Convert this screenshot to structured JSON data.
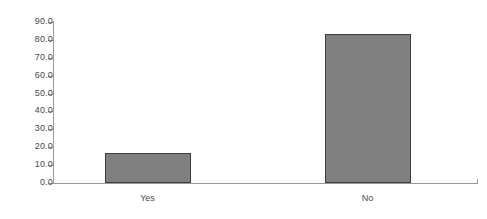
{
  "chart_data": {
    "type": "bar",
    "title": "",
    "subtitle": "",
    "xlabel": "",
    "ylabel": "",
    "categories": [
      "Yes",
      "No"
    ],
    "values": [
      16.5,
      83.5
    ],
    "ylim": [
      0.0,
      90.0
    ],
    "ytick_step": 10.0,
    "ytick_labels": [
      "0.0",
      "10.0",
      "20.0",
      "30.0",
      "40.0",
      "50.0",
      "60.0",
      "70.0",
      "80.0",
      "90.0"
    ],
    "ytick_values": [
      0.0,
      10.0,
      20.0,
      30.0,
      40.0,
      50.0,
      60.0,
      70.0,
      80.0,
      90.0
    ],
    "grid": false,
    "legend": false,
    "legend_position": "none",
    "data_labels": false,
    "colors": {
      "bar_fill": "#808080",
      "bar_border": "#3d3d3d",
      "axis": "#9a9a9a",
      "text": "#4a4a4a",
      "background": "#ffffff"
    }
  },
  "axes": {
    "y_axis_name": "value-axis",
    "x_axis_name": "category-axis"
  }
}
